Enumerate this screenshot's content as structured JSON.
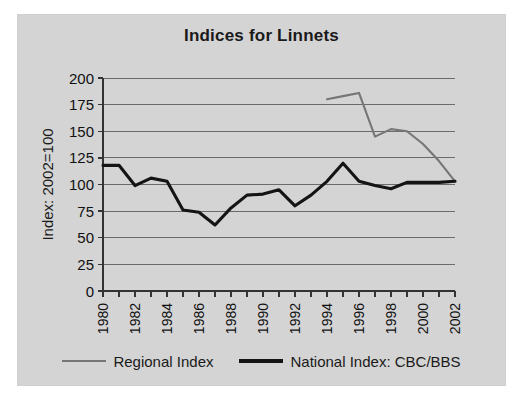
{
  "chart_data": {
    "type": "line",
    "title": "Indices for Linnets",
    "xlabel": "",
    "ylabel": "Index: 2002=100",
    "ylim": [
      0,
      200
    ],
    "xlim": [
      1980,
      2002
    ],
    "ytick_step": 25,
    "yticks": [
      "200",
      "175",
      "150",
      "125",
      "100",
      "75",
      "50",
      "25",
      "0"
    ],
    "xticks": [
      "1980",
      "1982",
      "1984",
      "1986",
      "1988",
      "1990",
      "1992",
      "1994",
      "1996",
      "1998",
      "2000",
      "2002"
    ],
    "xtick_years_all": [
      1980,
      1981,
      1982,
      1983,
      1984,
      1985,
      1986,
      1987,
      1988,
      1989,
      1990,
      1991,
      1992,
      1993,
      1994,
      1995,
      1996,
      1997,
      1998,
      1999,
      2000,
      2001,
      2002
    ],
    "grid": "horizontal",
    "legend_position": "bottom",
    "x": [
      1980,
      1981,
      1982,
      1983,
      1984,
      1985,
      1986,
      1987,
      1988,
      1989,
      1990,
      1991,
      1992,
      1993,
      1994,
      1995,
      1996,
      1997,
      1998,
      1999,
      2000,
      2001,
      2002
    ],
    "series": [
      {
        "name": "Regional Index",
        "color": "#767676",
        "x": [
          1994,
          1995,
          1996,
          1997,
          1998,
          1999,
          2000,
          2001,
          2002
        ],
        "values": [
          180,
          183,
          186,
          145,
          152,
          150,
          138,
          122,
          103
        ]
      },
      {
        "name": "National Index: CBC/BBS",
        "color": "#141414",
        "x": [
          1980,
          1981,
          1982,
          1983,
          1984,
          1985,
          1986,
          1987,
          1988,
          1989,
          1990,
          1991,
          1992,
          1993,
          1994,
          1995,
          1996,
          1997,
          1998,
          1999,
          2000,
          2001,
          2002
        ],
        "values": [
          118,
          118,
          99,
          106,
          103,
          76,
          74,
          62,
          78,
          90,
          91,
          95,
          80,
          90,
          103,
          120,
          103,
          99,
          96,
          102,
          102,
          102,
          103
        ]
      }
    ]
  },
  "legend": {
    "entries": [
      {
        "label": "Regional Index"
      },
      {
        "label": "National Index: CBC/BBS"
      }
    ]
  }
}
